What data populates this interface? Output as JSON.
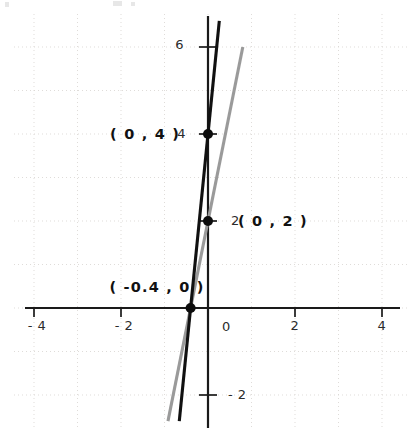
{
  "chart_data": {
    "type": "line",
    "title": "",
    "subtitle": "",
    "xlabel": "",
    "ylabel": "",
    "xlim": [
      -4.8,
      4.8
    ],
    "ylim": [
      -2.7,
      6.7
    ],
    "grid": true,
    "grid_spacing": 1,
    "legend": "none",
    "x_ticks": [
      -4,
      -2,
      0,
      2,
      4
    ],
    "x_tick_labels": [
      "- 4",
      "- 2",
      "0",
      "2",
      "4"
    ],
    "y_ticks": [
      -2,
      2,
      4,
      6
    ],
    "y_tick_labels": [
      "- 2",
      "2",
      "4",
      "6"
    ],
    "series": [
      {
        "name": "black-line",
        "color": "#111111",
        "equation": "y = 10x + 4",
        "slope": 10,
        "intercept": 4,
        "x": [
          -0.66,
          0.26
        ],
        "y": [
          -2.6,
          6.6
        ]
      },
      {
        "name": "gray-line",
        "color": "#9a9a9a",
        "equation": "y = 5x + 2",
        "slope": 5,
        "intercept": 2,
        "x": [
          -0.92,
          0.8
        ],
        "y": [
          -2.6,
          6.0
        ]
      }
    ],
    "points": [
      {
        "name": "y-intercept-black",
        "label": "( 0 , 4 )",
        "x": 0,
        "y": 4,
        "label_anchor": "end",
        "label_dx": -28,
        "label_dy": 5
      },
      {
        "name": "y-intercept-gray",
        "label": "( 0 , 2 )",
        "x": 0,
        "y": 2,
        "label_anchor": "start",
        "label_dx": 30,
        "label_dy": 5
      },
      {
        "name": "x-intercept-shared",
        "label": "( -0.4 , 0 )",
        "x": -0.4,
        "y": 0,
        "label_anchor": "end",
        "label_dx": 14,
        "label_dy": -16
      }
    ],
    "annotations": [
      {
        "name": "label-0-4",
        "text": "( 0 , 4 )"
      },
      {
        "name": "label-0-2",
        "text": "( 0 , 2 )"
      },
      {
        "name": "label-neg04-0",
        "text": "( -0.4 , 0 )"
      }
    ],
    "colors": {
      "axis": "#1a1a1a",
      "grid": "#d9d6d2",
      "black_series": "#111111",
      "gray_series": "#9a9a9a",
      "background": "#ffffff",
      "text": "#111111"
    }
  },
  "axis_labels": {
    "x_neg4": "- 4",
    "x_neg2": "- 2",
    "x_zero": "0",
    "x_2": "2",
    "x_4": "4",
    "y_6": "6",
    "y_4": "4",
    "y_2": "2",
    "y_neg2": "- 2"
  },
  "point_labels": {
    "black_intercept": "( 0 , 4 )",
    "gray_intercept": "( 0 , 2 )",
    "x_intercept": "( -0.4 , 0 )"
  }
}
